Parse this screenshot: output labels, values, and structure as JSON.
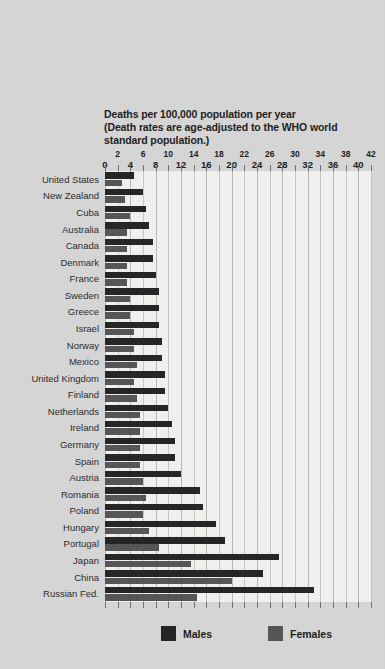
{
  "chart_data": {
    "type": "bar",
    "orientation": "horizontal",
    "title": "Deaths per 100,000 population per year (Death rates are age-adjusted to the WHO world standard population.)",
    "title_lines": [
      "Deaths per 100,000 population per year",
      "(Death rates are age-adjusted to the WHO world",
      "standard population.)"
    ],
    "xlabel": "",
    "ylabel": "",
    "xlim": [
      0,
      42
    ],
    "xticks": [
      0,
      2,
      4,
      6,
      8,
      10,
      12,
      14,
      16,
      18,
      20,
      22,
      24,
      26,
      28,
      30,
      32,
      34,
      36,
      38,
      40,
      42
    ],
    "xtick_labels": [
      "0",
      "2",
      "4",
      "6",
      "8",
      "10",
      "12",
      "14",
      "16",
      "18",
      "20",
      "22",
      "24",
      "26",
      "28",
      "30",
      "32",
      "34",
      "36",
      "38",
      "40",
      "42"
    ],
    "grid": true,
    "grid_axis": "x",
    "legend_position": "bottom",
    "categories": [
      "United States",
      "New Zealand",
      "Cuba",
      "Australia",
      "Canada",
      "Denmark",
      "France",
      "Sweden",
      "Greece",
      "Israel",
      "Norway",
      "Mexico",
      "United Kingdom",
      "Finland",
      "Netherlands",
      "Ireland",
      "Germany",
      "Spain",
      "Austria",
      "Romania",
      "Poland",
      "Hungary",
      "Portugal",
      "Japan",
      "China",
      "Russian Fed."
    ],
    "series": [
      {
        "name": "Males",
        "color": "#232323",
        "values": [
          4.5,
          6.0,
          6.5,
          7.0,
          7.5,
          7.5,
          8.0,
          8.5,
          8.5,
          8.5,
          9.0,
          9.0,
          9.5,
          9.5,
          10.0,
          10.5,
          11.0,
          11.0,
          12.0,
          15.0,
          15.5,
          17.5,
          19.0,
          27.5,
          25.0,
          33.0
        ]
      },
      {
        "name": "Females",
        "color": "#555555",
        "values": [
          2.7,
          3.2,
          4.0,
          3.5,
          3.5,
          3.5,
          3.5,
          4.0,
          4.0,
          4.5,
          4.5,
          5.0,
          4.5,
          5.0,
          5.5,
          5.5,
          5.5,
          5.5,
          6.0,
          6.5,
          6.0,
          7.0,
          8.5,
          13.5,
          20.0,
          14.5
        ]
      }
    ]
  },
  "legend": {
    "males_label": "Males",
    "females_label": "Females"
  },
  "colors": {
    "background": "#d7d7d7",
    "plot_background": "#f2f2f0",
    "male": "#232323",
    "female": "#555555",
    "gridline": "#c7c7c4",
    "text": "#1b1b1b"
  }
}
